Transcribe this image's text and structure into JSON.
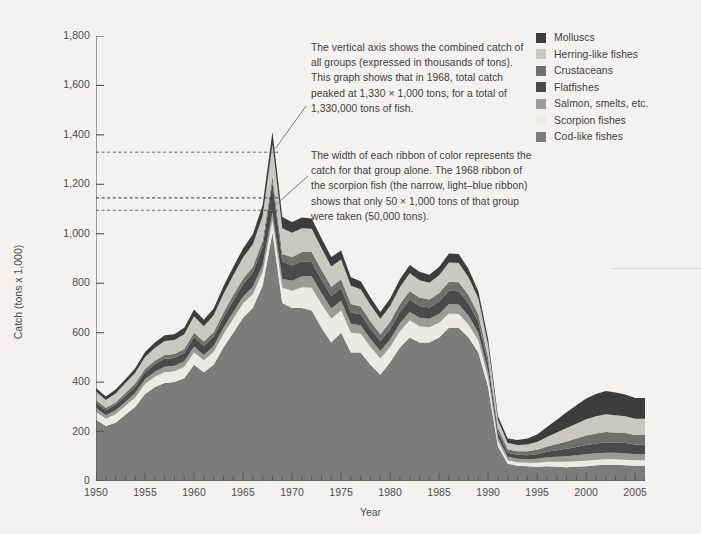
{
  "chart_data": {
    "type": "area",
    "title": "",
    "xlabel": "Year",
    "ylabel": "Catch (tons x 1,000)",
    "xlim": [
      1950,
      2006
    ],
    "ylim": [
      0,
      1800
    ],
    "ytick_labels": [
      "1,800",
      "1,600",
      "1,400",
      "1,200",
      "1,000",
      "800",
      "600",
      "400",
      "200",
      "0"
    ],
    "ytick_values": [
      1800,
      1600,
      1400,
      1200,
      1000,
      800,
      600,
      400,
      200,
      0
    ],
    "xtick_labels": [
      "1950",
      "1955",
      "1960",
      "1965",
      "1970",
      "1975",
      "1980",
      "1985",
      "1990",
      "1995",
      "2000",
      "2005"
    ],
    "xtick_values": [
      1950,
      1955,
      1960,
      1965,
      1970,
      1975,
      1980,
      1985,
      1990,
      1995,
      2000,
      2005
    ],
    "minor_xticks": "annual",
    "grid": false,
    "stacked": true,
    "legend_position": "top-right",
    "x": [
      1950,
      1951,
      1952,
      1953,
      1954,
      1955,
      1956,
      1957,
      1958,
      1959,
      1960,
      1961,
      1962,
      1963,
      1964,
      1965,
      1966,
      1967,
      1968,
      1969,
      1970,
      1971,
      1972,
      1973,
      1974,
      1975,
      1976,
      1977,
      1978,
      1979,
      1980,
      1981,
      1982,
      1983,
      1984,
      1985,
      1986,
      1987,
      1988,
      1989,
      1990,
      1991,
      1992,
      1993,
      1994,
      1995,
      1996,
      1997,
      1998,
      1999,
      2000,
      2001,
      2002,
      2003,
      2004,
      2005,
      2006
    ],
    "series": [
      {
        "name": "Cod-like fishes",
        "color": "#7c7c7a",
        "values": [
          248,
          222,
          236,
          268,
          300,
          352,
          380,
          396,
          400,
          416,
          470,
          440,
          470,
          540,
          600,
          660,
          700,
          790,
          1005,
          720,
          700,
          700,
          690,
          620,
          560,
          600,
          520,
          520,
          470,
          430,
          480,
          540,
          580,
          560,
          560,
          580,
          620,
          620,
          580,
          520,
          380,
          140,
          70,
          62,
          60,
          58,
          60,
          58,
          56,
          58,
          60,
          64,
          66,
          66,
          64,
          62,
          62
        ]
      },
      {
        "name": "Scorpion fishes",
        "color": "#eceae4",
        "values": [
          32,
          30,
          34,
          36,
          38,
          40,
          42,
          44,
          44,
          46,
          50,
          48,
          52,
          54,
          56,
          58,
          56,
          54,
          50,
          62,
          70,
          84,
          92,
          96,
          96,
          90,
          80,
          76,
          72,
          66,
          62,
          66,
          70,
          66,
          62,
          60,
          58,
          56,
          52,
          48,
          36,
          20,
          14,
          14,
          14,
          16,
          18,
          20,
          22,
          22,
          22,
          22,
          22,
          22,
          22,
          22,
          22
        ]
      },
      {
        "name": "Salmon, smelts, etc.",
        "color": "#9b9b97",
        "values": [
          16,
          14,
          16,
          16,
          18,
          20,
          20,
          22,
          22,
          22,
          24,
          22,
          24,
          26,
          28,
          28,
          30,
          30,
          32,
          36,
          40,
          44,
          46,
          44,
          42,
          40,
          36,
          34,
          32,
          30,
          30,
          32,
          34,
          34,
          34,
          36,
          38,
          38,
          36,
          32,
          26,
          16,
          14,
          14,
          14,
          16,
          18,
          20,
          22,
          24,
          26,
          26,
          26,
          26,
          26,
          24,
          24
        ]
      },
      {
        "name": "Flatfishes",
        "color": "#4a4a4a",
        "values": [
          22,
          20,
          22,
          24,
          26,
          28,
          30,
          32,
          32,
          34,
          38,
          36,
          38,
          42,
          46,
          50,
          56,
          74,
          120,
          70,
          62,
          60,
          58,
          54,
          50,
          50,
          46,
          44,
          42,
          40,
          42,
          46,
          50,
          48,
          46,
          50,
          54,
          54,
          50,
          44,
          34,
          22,
          16,
          16,
          16,
          18,
          22,
          26,
          30,
          34,
          38,
          40,
          42,
          42,
          42,
          40,
          40
        ]
      },
      {
        "name": "Crustaceans",
        "color": "#6f6f6d",
        "values": [
          10,
          10,
          10,
          12,
          12,
          14,
          14,
          16,
          16,
          16,
          18,
          18,
          18,
          20,
          22,
          22,
          24,
          24,
          26,
          30,
          34,
          38,
          40,
          40,
          38,
          36,
          34,
          32,
          30,
          28,
          30,
          32,
          34,
          34,
          32,
          34,
          36,
          36,
          34,
          30,
          24,
          16,
          14,
          14,
          16,
          18,
          22,
          26,
          30,
          34,
          38,
          40,
          42,
          40,
          40,
          38,
          38
        ]
      },
      {
        "name": "Herring-like fishes",
        "color": "#c9c8c3",
        "values": [
          34,
          32,
          36,
          40,
          44,
          48,
          52,
          56,
          56,
          60,
          66,
          62,
          68,
          74,
          80,
          86,
          92,
          100,
          128,
          104,
          98,
          96,
          94,
          88,
          82,
          80,
          74,
          70,
          66,
          62,
          64,
          68,
          72,
          70,
          68,
          72,
          78,
          78,
          72,
          64,
          50,
          32,
          26,
          26,
          28,
          32,
          38,
          46,
          54,
          60,
          66,
          70,
          72,
          70,
          68,
          66,
          66
        ]
      },
      {
        "name": "Molluscs",
        "color": "#3d3d3d",
        "values": [
          14,
          14,
          16,
          16,
          18,
          20,
          22,
          24,
          24,
          26,
          28,
          26,
          28,
          32,
          34,
          36,
          40,
          44,
          52,
          46,
          44,
          44,
          42,
          40,
          38,
          36,
          34,
          32,
          30,
          28,
          30,
          32,
          34,
          34,
          32,
          34,
          36,
          36,
          34,
          30,
          24,
          16,
          18,
          20,
          24,
          30,
          40,
          52,
          64,
          74,
          84,
          90,
          94,
          92,
          88,
          84,
          84
        ]
      }
    ],
    "reference_lines": [
      {
        "value": 1330,
        "label": "total catch peak 1968",
        "style": "dashed"
      },
      {
        "value": 1145,
        "label": "scorpion fish ribbon top 1968",
        "style": "dashed"
      },
      {
        "value": 1095,
        "label": "scorpion fish ribbon bottom 1968",
        "style": "dashed"
      }
    ],
    "annotations": [
      {
        "id": "total-catch",
        "text": "The vertical axis shows the combined catch of all groups (expressed in thousands of tons). This graph shows that in 1968, total catch peaked at 1,330 × 1,000 tons, for a total of 1,330,000 tons of fish."
      },
      {
        "id": "ribbon-width",
        "text": "The width of each ribbon of color represents the catch for that group alone. The 1968 ribbon of the scorpion fish (the narrow, light–blue ribbon) shows that only 50 × 1,000 tons of that group were taken (50,000 tons)."
      }
    ]
  },
  "legend": {
    "items": [
      {
        "label": "Molluscs",
        "color": "#3d3d3d"
      },
      {
        "label": "Herring-like fishes",
        "color": "#c9c8c3"
      },
      {
        "label": "Crustaceans",
        "color": "#6f6f6d"
      },
      {
        "label": "Flatfishes",
        "color": "#4a4a4a"
      },
      {
        "label": "Salmon, smelts, etc.",
        "color": "#9b9b97"
      },
      {
        "label": "Scorpion fishes",
        "color": "#eceae4"
      },
      {
        "label": "Cod-like fishes",
        "color": "#7c7c7a"
      }
    ]
  },
  "axes": {
    "x_title": "Year",
    "y_title": "Catch (tons x 1,000)"
  }
}
